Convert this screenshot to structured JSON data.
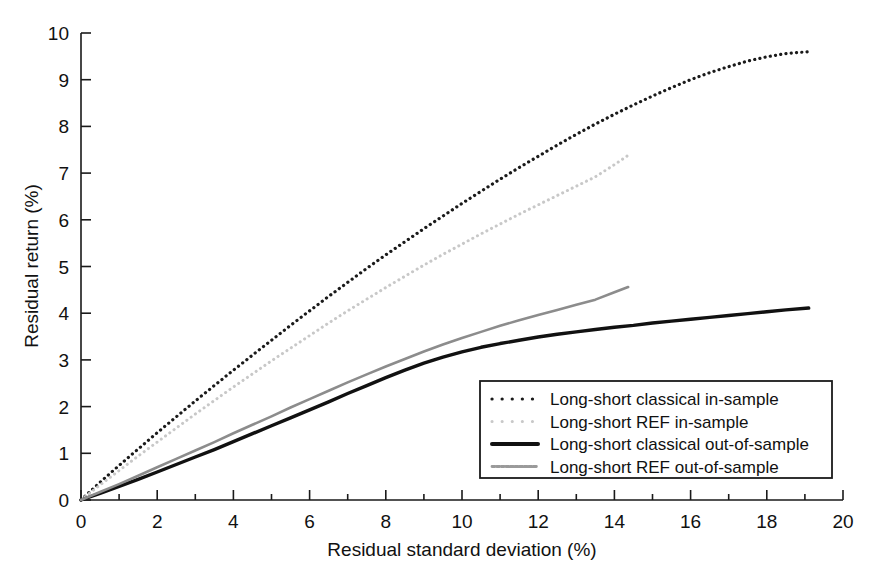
{
  "chart_data": {
    "type": "line",
    "title": "",
    "xlabel": "Residual standard deviation (%)",
    "ylabel": "Residual return (%)",
    "xlim": [
      0,
      20
    ],
    "ylim": [
      0,
      10
    ],
    "xticks": [
      0,
      2,
      4,
      6,
      8,
      10,
      12,
      14,
      16,
      18,
      20
    ],
    "xticklabels": [
      "0",
      "2",
      "4",
      "6",
      "8",
      "10",
      "12",
      "14",
      "16",
      "18",
      "20"
    ],
    "xminorticks": [
      1,
      3,
      5,
      7,
      9,
      11,
      13,
      15,
      17,
      19
    ],
    "yticks": [
      0,
      1,
      2,
      3,
      4,
      5,
      6,
      7,
      8,
      9,
      10
    ],
    "yticklabels": [
      "0",
      "1",
      "2",
      "3",
      "4",
      "5",
      "6",
      "7",
      "8",
      "9",
      "10"
    ],
    "grid": false,
    "legend_position": "lower right",
    "series": [
      {
        "name": "Long-short classical in-sample",
        "style": "dotted",
        "color": "#1a1a1a",
        "width": 3.2,
        "points": [
          [
            0.0,
            0.0
          ],
          [
            0.5,
            0.38
          ],
          [
            1.0,
            0.74
          ],
          [
            1.5,
            1.09
          ],
          [
            2.0,
            1.44
          ],
          [
            2.5,
            1.78
          ],
          [
            3.0,
            2.12
          ],
          [
            3.5,
            2.45
          ],
          [
            4.0,
            2.78
          ],
          [
            4.5,
            3.1
          ],
          [
            5.0,
            3.42
          ],
          [
            5.5,
            3.74
          ],
          [
            6.0,
            4.05
          ],
          [
            6.5,
            4.36
          ],
          [
            7.0,
            4.66
          ],
          [
            7.5,
            4.96
          ],
          [
            8.0,
            5.25
          ],
          [
            8.5,
            5.53
          ],
          [
            9.0,
            5.81
          ],
          [
            9.5,
            6.08
          ],
          [
            10.0,
            6.35
          ],
          [
            10.5,
            6.61
          ],
          [
            11.0,
            6.87
          ],
          [
            11.5,
            7.12
          ],
          [
            12.0,
            7.36
          ],
          [
            12.5,
            7.6
          ],
          [
            13.0,
            7.83
          ],
          [
            13.5,
            8.05
          ],
          [
            14.0,
            8.26
          ],
          [
            14.5,
            8.46
          ],
          [
            15.0,
            8.65
          ],
          [
            15.5,
            8.83
          ],
          [
            16.0,
            9.0
          ],
          [
            16.5,
            9.15
          ],
          [
            17.0,
            9.28
          ],
          [
            17.5,
            9.4
          ],
          [
            18.0,
            9.49
          ],
          [
            18.5,
            9.56
          ],
          [
            19.1,
            9.6
          ]
        ]
      },
      {
        "name": "Long-short REF in-sample",
        "style": "dotted",
        "color": "#c8c8c8",
        "width": 3.0,
        "points": [
          [
            0.0,
            0.0
          ],
          [
            0.5,
            0.32
          ],
          [
            1.0,
            0.63
          ],
          [
            1.5,
            0.94
          ],
          [
            2.0,
            1.24
          ],
          [
            2.5,
            1.54
          ],
          [
            3.0,
            1.84
          ],
          [
            3.5,
            2.13
          ],
          [
            4.0,
            2.42
          ],
          [
            4.5,
            2.7
          ],
          [
            5.0,
            2.98
          ],
          [
            5.5,
            3.25
          ],
          [
            6.0,
            3.52
          ],
          [
            6.5,
            3.79
          ],
          [
            7.0,
            4.05
          ],
          [
            7.5,
            4.3
          ],
          [
            8.0,
            4.55
          ],
          [
            8.5,
            4.79
          ],
          [
            9.0,
            5.03
          ],
          [
            9.5,
            5.26
          ],
          [
            10.0,
            5.48
          ],
          [
            10.5,
            5.7
          ],
          [
            11.0,
            5.91
          ],
          [
            11.5,
            6.12
          ],
          [
            12.0,
            6.32
          ],
          [
            12.5,
            6.52
          ],
          [
            13.0,
            6.72
          ],
          [
            13.5,
            6.92
          ],
          [
            14.0,
            7.18
          ],
          [
            14.36,
            7.38
          ]
        ]
      },
      {
        "name": "Long-short classical out-of-sample",
        "style": "solid",
        "color": "#111111",
        "width": 3.4,
        "points": [
          [
            0.0,
            0.0
          ],
          [
            0.5,
            0.14
          ],
          [
            1.0,
            0.29
          ],
          [
            1.5,
            0.44
          ],
          [
            2.0,
            0.6
          ],
          [
            2.5,
            0.76
          ],
          [
            3.0,
            0.92
          ],
          [
            3.5,
            1.08
          ],
          [
            4.0,
            1.25
          ],
          [
            4.5,
            1.42
          ],
          [
            5.0,
            1.59
          ],
          [
            5.5,
            1.76
          ],
          [
            6.0,
            1.93
          ],
          [
            6.5,
            2.1
          ],
          [
            7.0,
            2.28
          ],
          [
            7.5,
            2.45
          ],
          [
            8.0,
            2.62
          ],
          [
            8.5,
            2.78
          ],
          [
            9.0,
            2.93
          ],
          [
            9.5,
            3.06
          ],
          [
            10.0,
            3.17
          ],
          [
            10.5,
            3.27
          ],
          [
            11.0,
            3.35
          ],
          [
            11.5,
            3.42
          ],
          [
            12.0,
            3.49
          ],
          [
            12.5,
            3.55
          ],
          [
            13.0,
            3.6
          ],
          [
            13.5,
            3.65
          ],
          [
            14.0,
            3.7
          ],
          [
            14.5,
            3.74
          ],
          [
            15.0,
            3.79
          ],
          [
            15.5,
            3.83
          ],
          [
            16.0,
            3.87
          ],
          [
            16.5,
            3.91
          ],
          [
            17.0,
            3.95
          ],
          [
            17.5,
            3.99
          ],
          [
            18.0,
            4.03
          ],
          [
            18.5,
            4.07
          ],
          [
            19.1,
            4.11
          ]
        ]
      },
      {
        "name": "Long-short REF out-of-sample",
        "style": "solid",
        "color": "#8c8c8c",
        "width": 2.6,
        "points": [
          [
            0.0,
            0.0
          ],
          [
            0.5,
            0.17
          ],
          [
            1.0,
            0.34
          ],
          [
            1.5,
            0.52
          ],
          [
            2.0,
            0.7
          ],
          [
            2.5,
            0.88
          ],
          [
            3.0,
            1.06
          ],
          [
            3.5,
            1.24
          ],
          [
            4.0,
            1.43
          ],
          [
            4.5,
            1.61
          ],
          [
            5.0,
            1.79
          ],
          [
            5.5,
            1.98
          ],
          [
            6.0,
            2.16
          ],
          [
            6.5,
            2.34
          ],
          [
            7.0,
            2.52
          ],
          [
            7.5,
            2.69
          ],
          [
            8.0,
            2.86
          ],
          [
            8.5,
            3.02
          ],
          [
            9.0,
            3.18
          ],
          [
            9.5,
            3.33
          ],
          [
            10.0,
            3.47
          ],
          [
            10.5,
            3.6
          ],
          [
            11.0,
            3.73
          ],
          [
            11.5,
            3.85
          ],
          [
            12.0,
            3.96
          ],
          [
            12.5,
            4.07
          ],
          [
            13.0,
            4.18
          ],
          [
            13.5,
            4.29
          ],
          [
            14.0,
            4.45
          ],
          [
            14.36,
            4.56
          ]
        ]
      }
    ],
    "legend": [
      {
        "label": "Long-short classical in-sample",
        "style": "dotted",
        "color": "#1a1a1a",
        "width": 3.2
      },
      {
        "label": "Long-short REF in-sample",
        "style": "dotted",
        "color": "#c8c8c8",
        "width": 3.0
      },
      {
        "label": "Long-short classical out-of-sample",
        "style": "solid",
        "color": "#111111",
        "width": 4.0
      },
      {
        "label": "Long-short REF out-of-sample",
        "style": "dashed-fine",
        "color": "#9a9a9a",
        "width": 2.8
      }
    ]
  }
}
